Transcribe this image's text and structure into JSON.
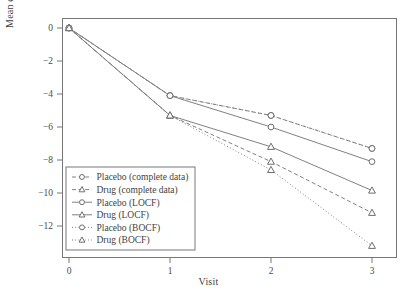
{
  "chart_data": {
    "type": "line",
    "title": "",
    "xlabel": "Visit",
    "ylabel": "Mean change from baseline",
    "x": [
      0,
      1,
      2,
      3
    ],
    "xticks": [
      "0",
      "1",
      "2",
      "3"
    ],
    "yticks": [
      "0",
      "-2",
      "-4",
      "-6",
      "-8",
      "-10",
      "-12"
    ],
    "xlim": [
      -0.07,
      3.25
    ],
    "ylim": [
      -13.9,
      0.6
    ],
    "grid": false,
    "legend_position": "lower left (inside axes)",
    "series": [
      {
        "name": "Placebo (complete data)",
        "marker": "circle",
        "line": "dashed",
        "values": [
          0,
          -4.1,
          -5.3,
          -7.3
        ]
      },
      {
        "name": "Drug (complete data)",
        "marker": "triangle",
        "line": "dashed",
        "values": [
          0,
          -5.3,
          -8.1,
          -11.2
        ]
      },
      {
        "name": "Placebo (LOCF)",
        "marker": "circle",
        "line": "solid",
        "values": [
          0,
          -4.1,
          -6.0,
          -8.1
        ]
      },
      {
        "name": "Drug (LOCF)",
        "marker": "triangle",
        "line": "solid",
        "values": [
          0,
          -5.3,
          -7.2,
          -9.85
        ]
      },
      {
        "name": "Placebo (BOCF)",
        "marker": "circle",
        "line": "dotted",
        "values": [
          0,
          -4.1,
          -5.3,
          -7.3
        ]
      },
      {
        "name": "Drug (BOCF)",
        "marker": "triangle",
        "line": "dotted",
        "values": [
          0,
          -5.3,
          -8.6,
          -13.2
        ]
      }
    ]
  },
  "legend": {
    "entries": [
      "Placebo (complete data)",
      "Drug (complete data)",
      "Placebo (LOCF)",
      "Drug (LOCF)",
      "Placebo (BOCF)",
      "Drug (BOCF)"
    ]
  },
  "colors": {
    "line": "#808080",
    "frame": "#777777",
    "text": "#3f3f3f",
    "marker_fill": "#ffffff"
  }
}
